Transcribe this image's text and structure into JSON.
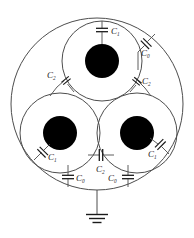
{
  "diagram": {
    "type": "circuit-schematic",
    "stroke_color": "#4d4d4d",
    "conductor_color": "#000000",
    "background": "#ffffff",
    "outer_sheath": {
      "name": "outer-sheath-circle",
      "cx": 97,
      "cy": 104,
      "r": 86
    },
    "cores": [
      {
        "name": "core-top",
        "cx": 102,
        "cy": 61,
        "insulation_r": 40,
        "conductor_r": 17
      },
      {
        "name": "core-bottom-left",
        "cx": 60,
        "cy": 133,
        "insulation_r": 40,
        "conductor_r": 17
      },
      {
        "name": "core-bottom-right",
        "cx": 137,
        "cy": 133,
        "insulation_r": 40,
        "conductor_r": 17
      }
    ],
    "ground": {
      "name": "ground-symbol",
      "x": 97,
      "y": 190,
      "lead_length": 22
    },
    "capacitors": [
      {
        "id": "cap-top-c1",
        "label": "C",
        "subscript": "1",
        "cx": 102,
        "cy": 30,
        "angle": 0,
        "label_x": 110,
        "label_y": 32
      },
      {
        "id": "cap-top-right-c0",
        "label": "C",
        "subscript": "0",
        "cx": 145,
        "cy": 43,
        "angle": 52,
        "label_x": 147,
        "label_y": 55
      },
      {
        "id": "cap-left-c2",
        "label": "C",
        "subscript": "2",
        "cx": 65,
        "cy": 81,
        "angle": 62,
        "label_x": 50,
        "label_y": 76
      },
      {
        "id": "cap-right-c2",
        "label": "C",
        "subscript": "2",
        "cx": 137,
        "cy": 82,
        "angle": -62,
        "label_x": 143,
        "label_y": 83
      },
      {
        "id": "cap-bottom-left-c1",
        "label": "C",
        "subscript": "1",
        "cx": 46,
        "cy": 148,
        "angle": 54,
        "label_x": 51,
        "label_y": 157
      },
      {
        "id": "cap-bottom-right-c1",
        "label": "C",
        "subscript": "1",
        "cx": 157,
        "cy": 142,
        "angle": -54,
        "label_x": 152,
        "label_y": 153
      },
      {
        "id": "cap-bottom-center-c2",
        "label": "C",
        "subscript": "2",
        "cx": 102,
        "cy": 155,
        "angle": 90,
        "label_x": 98,
        "label_y": 170
      },
      {
        "id": "cap-bottom-left-c0",
        "label": "C",
        "subscript": "0",
        "cx": 68,
        "cy": 178,
        "angle": 0,
        "label_x": 75,
        "label_y": 181
      },
      {
        "id": "cap-bottom-right-c0",
        "label": "C",
        "subscript": "0",
        "cx": 128,
        "cy": 178,
        "angle": 0,
        "label_x": 112,
        "label_y": 181
      }
    ],
    "legend": {
      "c0_name": "C0",
      "c1_name": "C1",
      "c2_name": "C2"
    }
  }
}
